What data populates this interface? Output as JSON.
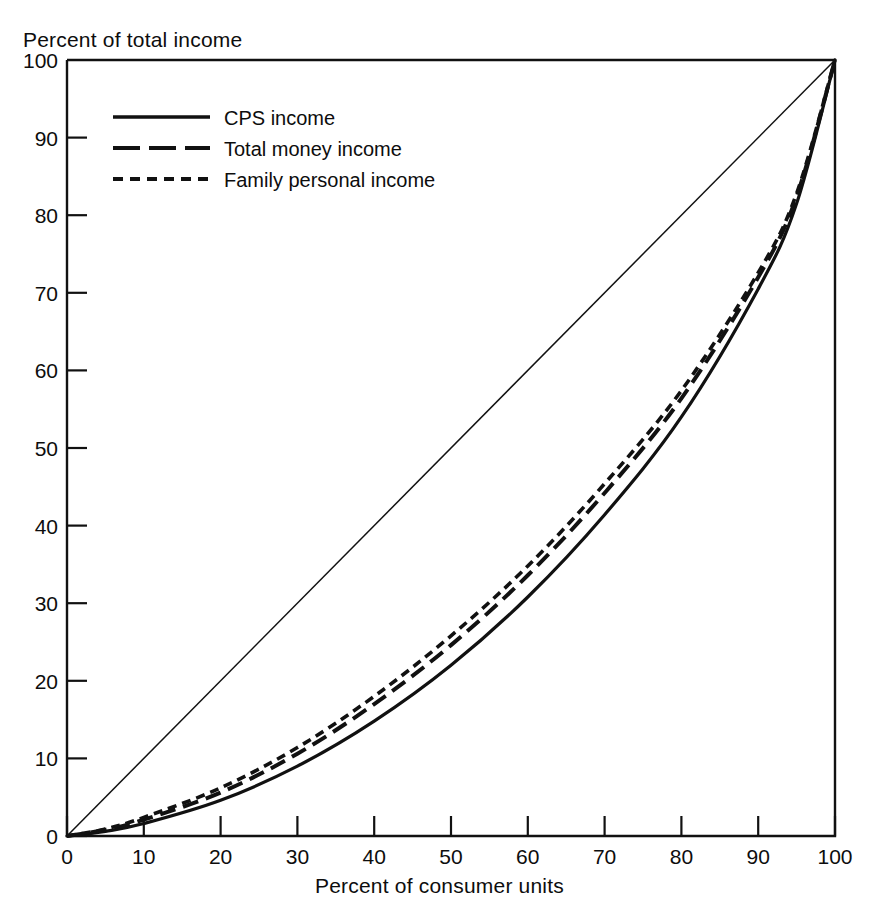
{
  "chart_data": {
    "type": "line",
    "title": "",
    "xlabel": "Percent of consumer units",
    "ylabel": "Percent of total income",
    "xlim": [
      0,
      100
    ],
    "ylim": [
      0,
      100
    ],
    "xticks": [
      "0",
      "10",
      "20",
      "30",
      "40",
      "50",
      "60",
      "70",
      "80",
      "90",
      "100"
    ],
    "yticks": [
      "0",
      "10",
      "20",
      "30",
      "40",
      "50",
      "60",
      "70",
      "80",
      "90",
      "100"
    ],
    "grid": false,
    "legend_position": "upper-left",
    "x": [
      0,
      5,
      10,
      20,
      30,
      40,
      50,
      60,
      70,
      80,
      90,
      95,
      100
    ],
    "reference_line": {
      "name": "Line of equality",
      "x": [
        0,
        100
      ],
      "values": [
        0,
        100
      ]
    },
    "series": [
      {
        "name": "CPS income",
        "style": "solid",
        "values": [
          0,
          0.6,
          1.6,
          4.6,
          9.0,
          14.8,
          22.0,
          30.8,
          41.4,
          54.0,
          70.5,
          81.5,
          100
        ]
      },
      {
        "name": "Total money income",
        "style": "long-dash",
        "values": [
          0,
          0.8,
          2.1,
          5.6,
          10.6,
          17.0,
          24.6,
          33.6,
          44.2,
          56.4,
          72.0,
          82.4,
          100
        ]
      },
      {
        "name": "Family personal income",
        "style": "short-dash",
        "values": [
          0,
          0.9,
          2.4,
          6.2,
          11.4,
          18.0,
          25.8,
          34.8,
          45.4,
          57.4,
          72.6,
          82.8,
          100
        ]
      }
    ]
  },
  "legend": {
    "entries": [
      {
        "label": "CPS income",
        "style": "solid"
      },
      {
        "label": "Total money income",
        "style": "long-dash"
      },
      {
        "label": "Family personal income",
        "style": "short-dash"
      }
    ]
  },
  "axes": {
    "y_axis_title": "Percent of total income",
    "x_axis_title": "Percent of consumer units"
  }
}
